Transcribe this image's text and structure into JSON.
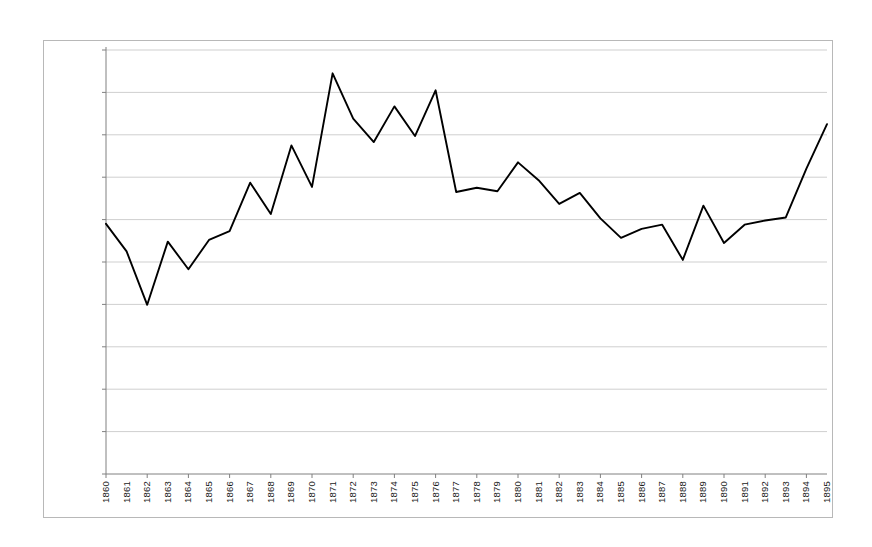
{
  "chart_data": {
    "type": "line",
    "title": "",
    "subtitle": "",
    "xlabel": "",
    "ylabel": "",
    "x": [
      1860,
      1861,
      1862,
      1863,
      1864,
      1865,
      1866,
      1867,
      1868,
      1869,
      1870,
      1871,
      1872,
      1873,
      1874,
      1875,
      1876,
      1877,
      1878,
      1879,
      1880,
      1881,
      1882,
      1883,
      1884,
      1885,
      1886,
      1887,
      1888,
      1889,
      1890,
      1891,
      1892,
      1893,
      1894,
      1895
    ],
    "categories": [
      "1860",
      "1861",
      "1862",
      "1863",
      "1864",
      "1865",
      "1866",
      "1867",
      "1868",
      "1869",
      "1870",
      "1871",
      "1872",
      "1873",
      "1874",
      "1875",
      "1876",
      "1877",
      "1878",
      "1879",
      "1880",
      "1881",
      "1882",
      "1883",
      "1884",
      "1885",
      "1886",
      "1887",
      "1888",
      "1889",
      "1890",
      "1891",
      "1892",
      "1893",
      "1894",
      "1895"
    ],
    "values": [
      0.59,
      0.525,
      0.399,
      0.548,
      0.483,
      0.552,
      0.573,
      0.687,
      0.613,
      0.775,
      0.677,
      0.945,
      0.838,
      0.783,
      0.867,
      0.797,
      0.905,
      0.665,
      0.675,
      0.667,
      0.735,
      0.693,
      0.637,
      0.663,
      0.603,
      0.557,
      0.578,
      0.588,
      0.505,
      0.633,
      0.545,
      0.588,
      0.598,
      0.605,
      0.72,
      0.825
    ],
    "series": [
      {
        "name": "",
        "values": [
          0.59,
          0.525,
          0.399,
          0.548,
          0.483,
          0.552,
          0.573,
          0.687,
          0.613,
          0.775,
          0.677,
          0.945,
          0.838,
          0.783,
          0.867,
          0.797,
          0.905,
          0.665,
          0.675,
          0.667,
          0.735,
          0.693,
          0.637,
          0.663,
          0.603,
          0.557,
          0.578,
          0.588,
          0.505,
          0.633,
          0.545,
          0.588,
          0.598,
          0.605,
          0.72,
          0.825
        ],
        "color": "#000000"
      }
    ],
    "ylim": [
      0,
      1.0
    ],
    "yticks": [
      0,
      0.1,
      0.2,
      0.3,
      0.4,
      0.5,
      0.6,
      0.7,
      0.8,
      0.9,
      1.0
    ],
    "ytick_labels": [
      "0.00000%",
      "0.10000%",
      "0.20000%",
      "0.30000%",
      "0.40000%",
      "0.50000%",
      "0.60000%",
      "0.70000%",
      "0.80000%",
      "0.90000%",
      "1.00000%"
    ],
    "xtick_labels": [
      "1860",
      "1861",
      "1862",
      "1863",
      "1864",
      "1865",
      "1866",
      "1867",
      "1868",
      "1869",
      "1870",
      "1871",
      "1872",
      "1873",
      "1874",
      "1875",
      "1876",
      "1877",
      "1878",
      "1879",
      "1880",
      "1881",
      "1882",
      "1883",
      "1884",
      "1885",
      "1886",
      "1887",
      "1888",
      "1889",
      "1890",
      "1891",
      "1892",
      "1893",
      "1894",
      "1895"
    ],
    "grid": true,
    "grid_axis": "y",
    "legend": false,
    "legend_position": "none",
    "annotations": [],
    "colors": {
      "line": "#000000",
      "grid": "#cfcfcf",
      "axis": "#808080",
      "border": "#b8b8b8",
      "background": "#ffffff",
      "text": "#1a1a1a"
    }
  }
}
